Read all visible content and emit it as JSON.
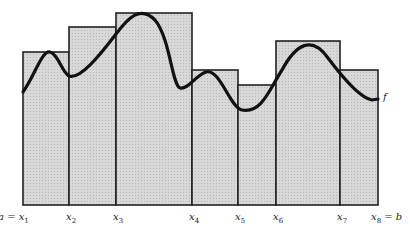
{
  "figure": {
    "type": "Riemann sum rectangles over a curve",
    "curve_label": "f",
    "partition_labels": [
      {
        "var": "a = x",
        "sub": "1",
        "x": 23
      },
      {
        "var": "x",
        "sub": "2",
        "x": 69
      },
      {
        "var": "x",
        "sub": "3",
        "x": 116
      },
      {
        "var": "x",
        "sub": "4",
        "x": 192
      },
      {
        "var": "x",
        "sub": "5",
        "x": 238
      },
      {
        "var": "x",
        "sub": "6",
        "x": 276
      },
      {
        "var": "x",
        "sub": "7",
        "x": 340
      },
      {
        "var": "x",
        "sub": "8",
        "suffix": " = b",
        "x": 378
      }
    ],
    "rectangles": [
      {
        "x0": 23,
        "x1": 69,
        "top": 52
      },
      {
        "x0": 69,
        "x1": 116,
        "top": 27
      },
      {
        "x0": 116,
        "x1": 192,
        "top": 13
      },
      {
        "x0": 192,
        "x1": 238,
        "top": 70
      },
      {
        "x0": 238,
        "x1": 276,
        "top": 85
      },
      {
        "x0": 276,
        "x1": 340,
        "top": 41
      },
      {
        "x0": 340,
        "x1": 378,
        "top": 70
      }
    ],
    "baseline_y": 205,
    "colors": {
      "fill": "#d4d4d4",
      "stroke": "#222222",
      "curve": "#111111"
    }
  }
}
